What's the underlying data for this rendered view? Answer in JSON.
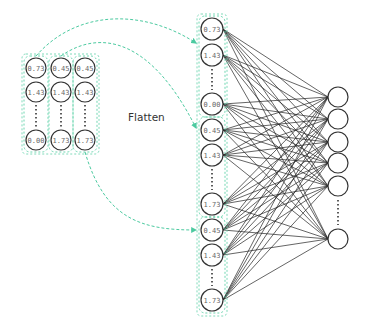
{
  "diagram": {
    "title": "Flatten",
    "colors": {
      "node_stroke": "#333333",
      "edge": "#222222",
      "dashed_group": "#5fd1a8",
      "arrow": "#4ccaa0",
      "label": "#666666"
    },
    "input_grid": {
      "columns": [
        {
          "x": 36,
          "values": [
            "0.73",
            "1.43",
            "0.00"
          ]
        },
        {
          "x": 61,
          "values": [
            "0.45",
            "1.43",
            "1.73"
          ]
        },
        {
          "x": 85,
          "values": [
            "0.45",
            "1.43",
            "1.73"
          ]
        }
      ],
      "row_y": [
        68,
        92,
        140
      ],
      "ellipsis_between_rows": [
        1,
        2
      ]
    },
    "flattened_layer": {
      "x": 212,
      "nodes": [
        {
          "y": 29,
          "value": "0.73"
        },
        {
          "y": 55,
          "value": "1.43"
        },
        {
          "y": 104,
          "value": "0.00"
        },
        {
          "y": 130,
          "value": "0.45"
        },
        {
          "y": 155,
          "value": "1.43"
        },
        {
          "y": 204,
          "value": "1.73"
        },
        {
          "y": 230,
          "value": "0.45"
        },
        {
          "y": 255,
          "value": "1.43"
        },
        {
          "y": 300,
          "value": "1.73"
        }
      ],
      "groups": [
        [
          0,
          2
        ],
        [
          3,
          5
        ],
        [
          6,
          8
        ]
      ]
    },
    "output_layer": {
      "x": 338,
      "node_y": [
        97,
        119,
        142,
        163,
        186,
        239
      ],
      "ellipsis": true
    },
    "arrows": [
      {
        "from_column": 0,
        "to_group": 0
      },
      {
        "from_column": 1,
        "to_group": 1
      },
      {
        "from_column": 2,
        "to_group": 2
      }
    ]
  }
}
